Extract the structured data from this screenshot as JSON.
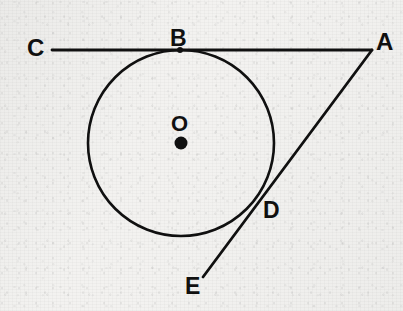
{
  "figure": {
    "background_color": "#f3f2f0",
    "ink_color": "#101010",
    "stroke_width": 2.6
  },
  "labels": {
    "c": "C",
    "b": "B",
    "a": "A",
    "o": "O",
    "d": "D",
    "e": "E"
  },
  "geometry": {
    "circle": {
      "center_x": 181,
      "center_y": 143,
      "radius": 93,
      "center_dot_radius": 6.5
    },
    "points": {
      "C": {
        "x": 52,
        "y": 50
      },
      "B": {
        "x": 180,
        "y": 50,
        "dot_radius": 3
      },
      "A": {
        "x": 372,
        "y": 50
      },
      "O": {
        "x": 181,
        "y": 143
      },
      "D": {
        "x": 258,
        "y": 198
      },
      "E": {
        "x": 203,
        "y": 277
      }
    },
    "segments": [
      {
        "name": "line-CA",
        "from": "C",
        "to": "A"
      },
      {
        "name": "line-AE",
        "from": "A",
        "to": "E"
      }
    ]
  },
  "label_positions": {
    "c": {
      "left": 27,
      "top": 36,
      "size": 24
    },
    "b": {
      "left": 170,
      "top": 27,
      "size": 23
    },
    "a": {
      "left": 376,
      "top": 30,
      "size": 24
    },
    "o": {
      "left": 171,
      "top": 113,
      "size": 22
    },
    "d": {
      "left": 263,
      "top": 199,
      "size": 23
    },
    "e": {
      "left": 185,
      "top": 275,
      "size": 23
    }
  }
}
